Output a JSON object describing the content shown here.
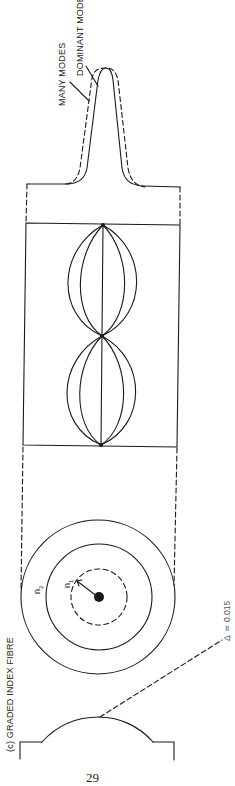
{
  "figure": {
    "caption": "(c)  GRADED INDEX FIBRE",
    "page_number": "29",
    "orientation": "rotated -90deg",
    "stroke_color": "#1a1a1a",
    "background": "#ffffff"
  },
  "output_pulse": {
    "labels": {
      "many_modes": "MANY MODES",
      "dominant_mode": "DOMINANT MODE"
    },
    "curves": [
      {
        "name": "dominant mode",
        "style": "solid"
      },
      {
        "name": "many modes",
        "style": "dashed"
      }
    ]
  },
  "ray_paths": {
    "description": "sinusoidal ray paths refocusing periodically along the fibre axis",
    "focus_points": 3,
    "ray_count_per_half_period": 5
  },
  "cross_section": {
    "core_label": "n",
    "core_subscript": "1",
    "cladding_label": "n",
    "cladding_subscript": "2",
    "rings": [
      "cladding outer",
      "core boundary",
      "dashed index contour",
      "centre"
    ]
  },
  "index_profile": {
    "shape": "parabolic",
    "annotation_prefix": "Δ",
    "annotation_relation": "≃",
    "annotation_value": "0.015"
  }
}
